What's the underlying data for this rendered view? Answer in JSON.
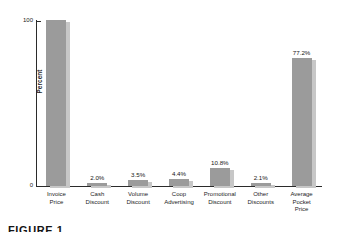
{
  "figure": {
    "caption": "FIGURE 1"
  },
  "chart_data": {
    "type": "bar",
    "title": "",
    "subtitle": "",
    "xlabel": "",
    "ylabel": "Percent",
    "ylim": [
      0,
      100
    ],
    "yticks": [
      0,
      100
    ],
    "ytick_labels": [
      "0",
      "100"
    ],
    "grid": false,
    "legend": null,
    "bar_color": "#9b9b9b",
    "bar_shadow_color": "#c7c7c7",
    "background_color": "#ffffff",
    "axis_color": "#2b2b2b",
    "categories": [
      "Invoice Price",
      "Cash Discount",
      "Volume Discount",
      "Coop Advertising",
      "Promotional Discount",
      "Other Discounts",
      "Average Pocket Price"
    ],
    "category_lines": [
      [
        "Invoice",
        "Price"
      ],
      [
        "Cash",
        "Discount"
      ],
      [
        "Volume",
        "Discount"
      ],
      [
        "Coop",
        "Advertising"
      ],
      [
        "Promotional",
        "Discount"
      ],
      [
        "Other",
        "Discounts"
      ],
      [
        "Average",
        "Pocket",
        "Price"
      ]
    ],
    "values": [
      100.0,
      2.0,
      3.5,
      4.4,
      10.8,
      2.1,
      77.2
    ],
    "data_labels": [
      "",
      "2.0%",
      "3.5%",
      "4.4%",
      "10.8%",
      "2.1%",
      "77.2%"
    ]
  }
}
